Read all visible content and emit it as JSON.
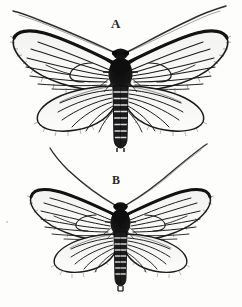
{
  "plate": {
    "title": "",
    "background_color": "#fdfdfc",
    "ink_color": "#1b1b1b",
    "medium": "black-and-white line engraving",
    "view": "dorsal, wings spread",
    "specimen_count": 2
  },
  "specimens": [
    {
      "label": "A",
      "position": "top",
      "relative_size": "larger",
      "wingspan_px": 212,
      "body_length_px": 92,
      "thorax_shading": "solid black",
      "abdomen": "banded, ringed segments",
      "abdomen_segments": 9,
      "antennae": "long, curved, sweeping upward and outward",
      "forewing_pairs": 2,
      "hindwing_pairs": 2,
      "wing_appearance": "semi-hyaline with dark radiating veins and dark costal margin"
    },
    {
      "label": "B",
      "position": "bottom",
      "relative_size": "smaller",
      "wingspan_px": 182,
      "body_length_px": 78,
      "thorax_shading": "solid black",
      "abdomen": "banded, ringed segments",
      "abdomen_segments": 8,
      "antennae": "long, curved, sweeping upward and outward",
      "forewing_pairs": 2,
      "hindwing_pairs": 2,
      "wing_appearance": "semi-hyaline with dark radiating veins and dark costal margin"
    }
  ],
  "colors": {
    "ink": "#1b1b1b",
    "mid_ink": "#4a4a4a",
    "light_ink": "#7d7d7d",
    "paper": "#fdfdfc",
    "wing_membrane": "#fbfbfa"
  }
}
